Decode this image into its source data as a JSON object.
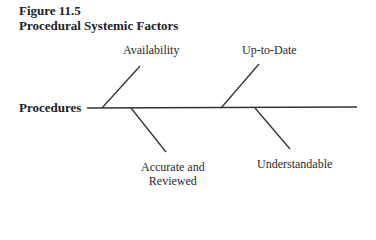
{
  "figure": {
    "number": "Figure 11.5",
    "title": "Procedural Systemic Factors"
  },
  "diagram": {
    "type": "fishbone",
    "spine_label": "Procedures",
    "branches": [
      {
        "label": "Availability",
        "position": "upper-left"
      },
      {
        "label": "Up-to-Date",
        "position": "upper-right"
      },
      {
        "label_line1": "Accurate and",
        "label_line2": "Reviewed",
        "position": "lower-left"
      },
      {
        "label": "Understandable",
        "position": "lower-right"
      }
    ]
  }
}
